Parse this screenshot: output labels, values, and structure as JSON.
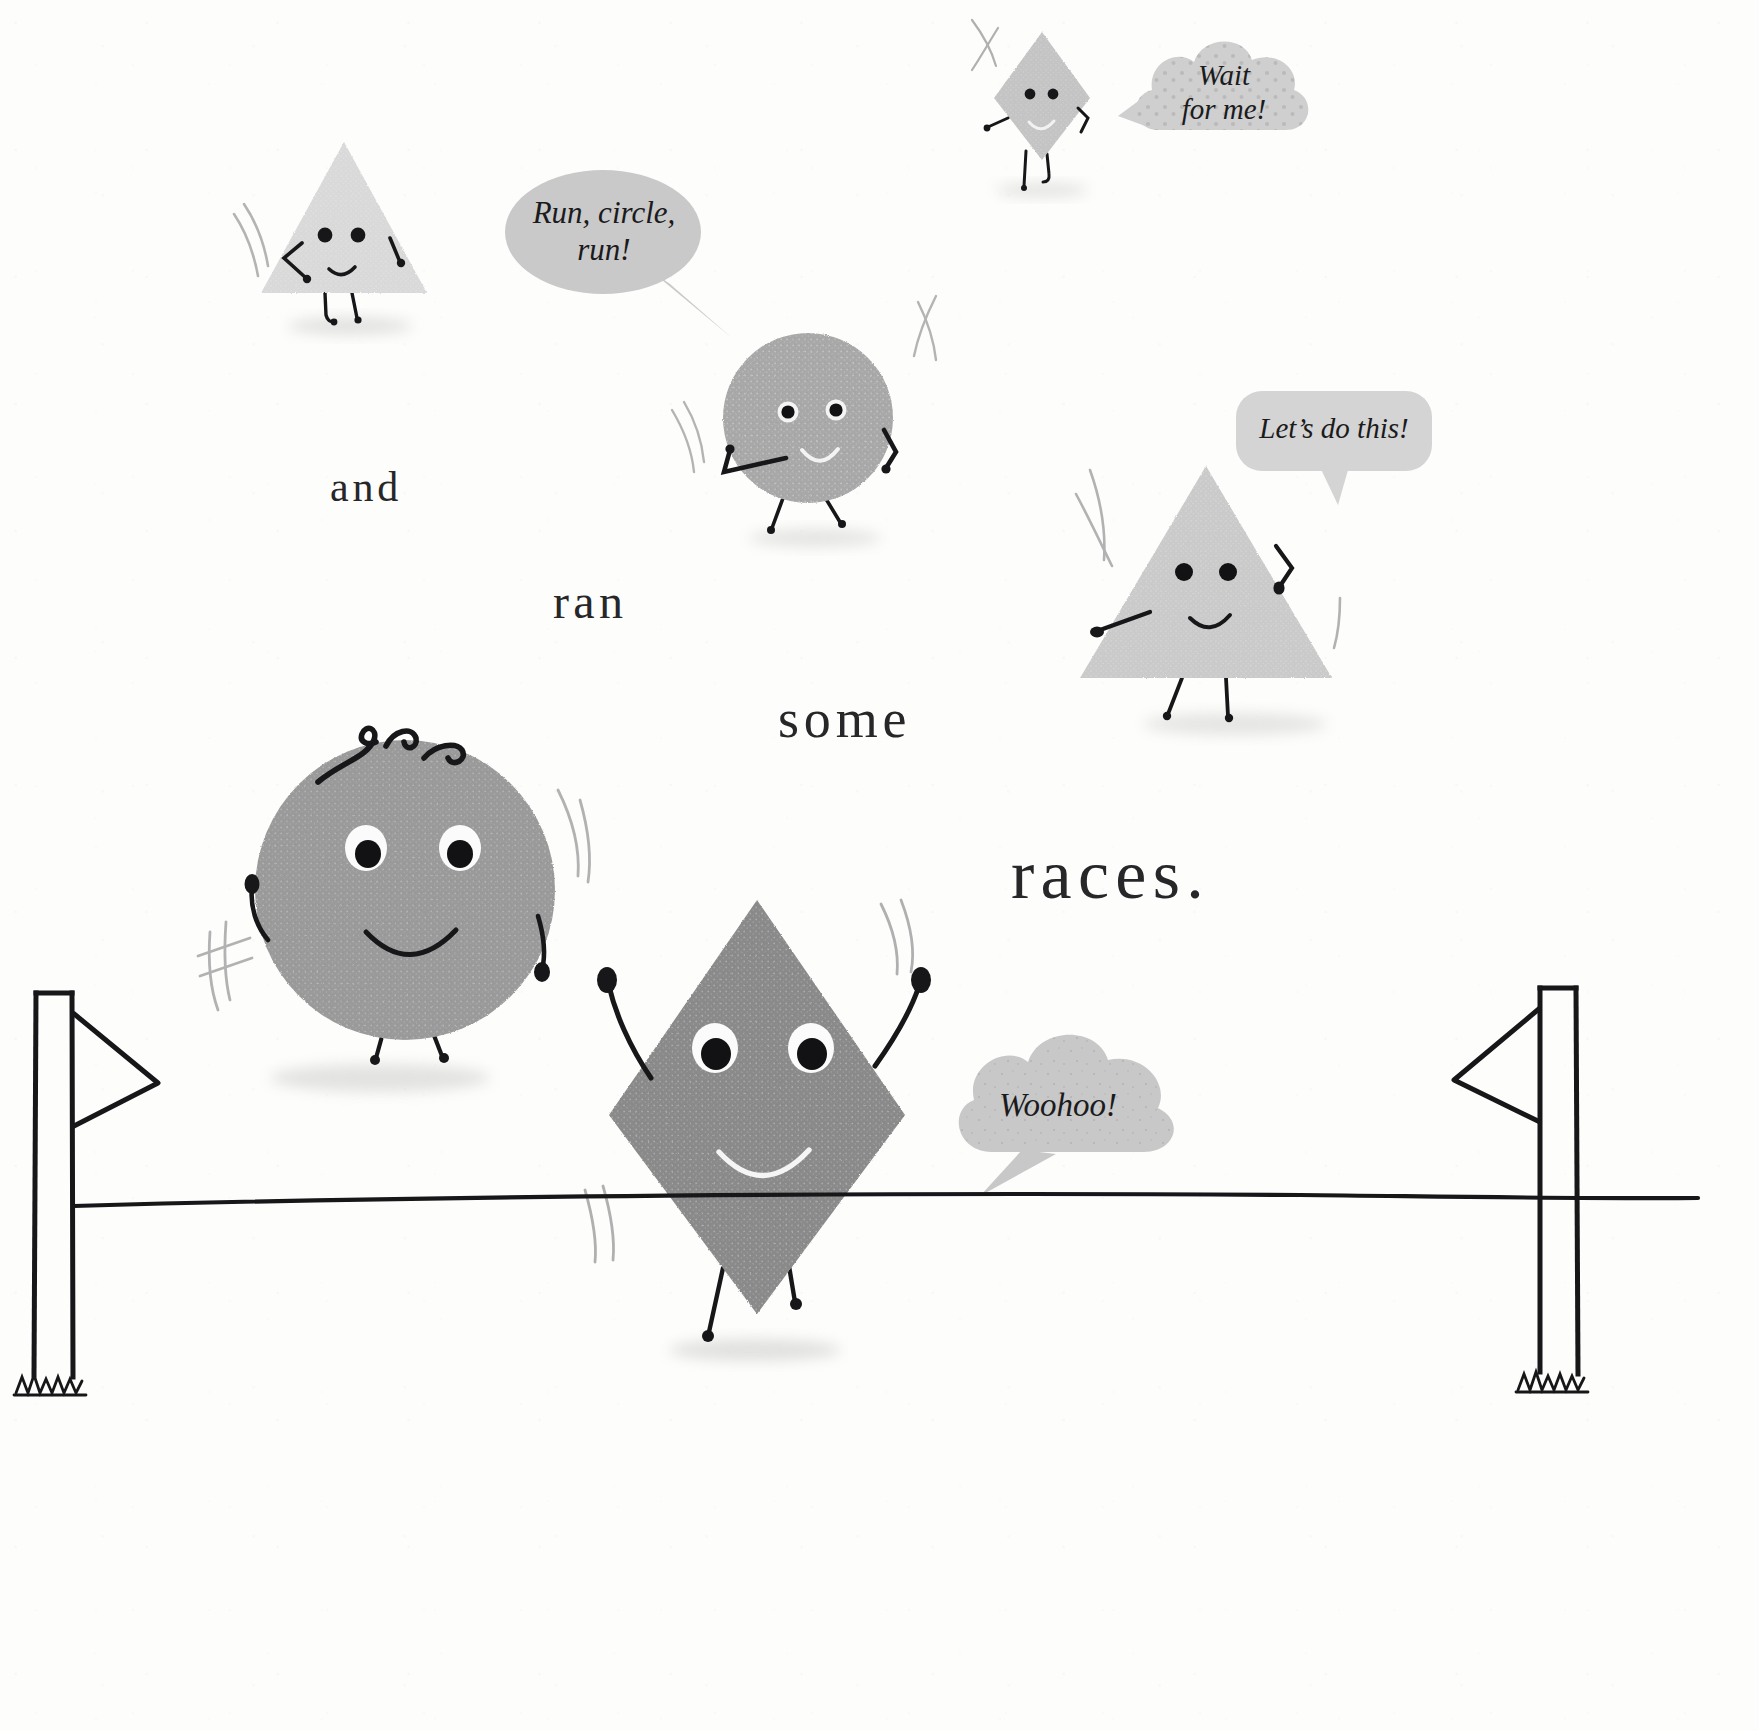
{
  "page": {
    "width": 1759,
    "height": 1731,
    "background_color": "#fdfdfb",
    "ink_color": "#1b1b1d",
    "text_color": "#27272a"
  },
  "narration": {
    "words": [
      {
        "id": "and",
        "text": "and",
        "x": 330,
        "y": 466,
        "size": 42
      },
      {
        "id": "ran",
        "text": "ran",
        "x": 553,
        "y": 578,
        "size": 48
      },
      {
        "id": "some",
        "text": "some",
        "x": 778,
        "y": 692,
        "size": 54
      },
      {
        "id": "races",
        "text": "races.",
        "x": 1011,
        "y": 840,
        "size": 70
      }
    ]
  },
  "speech_bubbles": [
    {
      "id": "wait-for-me",
      "text": "Wait\nfor me!",
      "shape": "cloud",
      "fill": "#cfcfcf",
      "pattern": "dots",
      "x": 1120,
      "y": 30,
      "w": 190,
      "h": 120,
      "font_size": 29,
      "tail": "left"
    },
    {
      "id": "run-circle-run",
      "text": "Run, circle,\nrun!",
      "shape": "ellipse",
      "fill": "#c9c9c9",
      "pattern": "plain",
      "x": 510,
      "y": 168,
      "w": 205,
      "h": 140,
      "font_size": 31,
      "tail": "down-right"
    },
    {
      "id": "lets-do-this",
      "text": "Let’s do this!",
      "shape": "rounded-rect",
      "fill": "#d4d4d4",
      "pattern": "plain",
      "x": 1240,
      "y": 393,
      "w": 195,
      "h": 83,
      "font_size": 29,
      "tail": "down"
    },
    {
      "id": "woohoo",
      "text": "Woohoo!",
      "shape": "cloud",
      "fill": "#c8c8c8",
      "pattern": "speckle",
      "x": 940,
      "y": 1015,
      "w": 225,
      "h": 155,
      "font_size": 33,
      "tail": "down-left"
    }
  ],
  "characters": [
    {
      "id": "small-triangle",
      "shape": "triangle",
      "fill": "#d9d9d9",
      "x": 258,
      "y": 142,
      "w": 170,
      "h": 155,
      "eyes": "dot",
      "mouth": "smile-dark",
      "has_arms": true,
      "has_legs": true,
      "motion_lines": "left"
    },
    {
      "id": "small-diamond",
      "shape": "diamond",
      "fill": "#c4c4c4",
      "x": 990,
      "y": 26,
      "w": 92,
      "h": 122,
      "eyes": "dot",
      "mouth": "smile-light",
      "has_arms": true,
      "has_legs": true,
      "motion_lines": "left"
    },
    {
      "id": "medium-circle",
      "shape": "circle",
      "fill": "#a8a8a8",
      "x": 716,
      "y": 307,
      "w": 170,
      "h": 170,
      "eyes": "ringed",
      "mouth": "smile-light",
      "has_arms": true,
      "has_legs": true,
      "motion_lines": "both"
    },
    {
      "id": "large-triangle",
      "shape": "triangle",
      "fill": "#cacaca",
      "x": 1068,
      "y": 463,
      "w": 262,
      "h": 215,
      "eyes": "dot",
      "mouth": "smile-dark",
      "has_arms": true,
      "has_legs": true,
      "motion_lines": "left"
    },
    {
      "id": "large-circle",
      "shape": "circle",
      "fill": "#9a9a9a",
      "x": 258,
      "y": 735,
      "w": 300,
      "h": 300,
      "eyes": "white-big",
      "mouth": "smile-dark",
      "hair": "three-curls",
      "has_arms": true,
      "has_legs": true,
      "motion_lines": "both"
    },
    {
      "id": "large-diamond",
      "shape": "diamond",
      "fill": "#8a8a8a",
      "x": 611,
      "y": 885,
      "w": 295,
      "h": 435,
      "eyes": "white-big",
      "mouth": "smile-light",
      "has_arms": true,
      "has_legs": true,
      "motion_lines": "both"
    }
  ],
  "scene": {
    "finish_line": {
      "id": "finish-line-ribbon",
      "y": 1198,
      "x_start": 72,
      "x_end": 1700
    },
    "posts": [
      {
        "id": "finish-post-left",
        "x": 36,
        "y": 990,
        "height": 400,
        "flag_direction": "right"
      },
      {
        "id": "finish-post-right",
        "x": 1432,
        "y": 985,
        "height": 400,
        "flag_direction": "left"
      }
    ],
    "grass_tufts": [
      {
        "id": "grass-left",
        "x": 8,
        "y": 1378
      },
      {
        "id": "grass-right",
        "x": 1404,
        "y": 1378
      }
    ]
  }
}
